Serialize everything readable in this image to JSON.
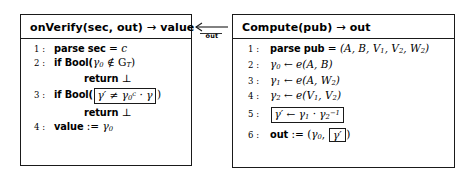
{
  "diagram": {
    "type": "algorithm-pseudocode-pair",
    "connector": {
      "label": "out",
      "direction": "right-to-left",
      "icon": "left-arrow-icon"
    }
  },
  "left_box": {
    "name": "onVerify",
    "header": {
      "fn": "onVerify",
      "args": "(sec, out)",
      "arrow": "→",
      "result": "value"
    },
    "lines": [
      {
        "no": "1 :",
        "keyword": "parse",
        "rest": " sec = c"
      },
      {
        "no": "2 :",
        "keyword": "if Bool(",
        "rest": "γ₀ ∉ G_T )"
      },
      {
        "no": "",
        "keyword": "return",
        "rest": " ⊥"
      },
      {
        "no": "3 :",
        "keyword": "if Bool(",
        "boxed": "γ′ ≠ γ₀ᶜ · γ",
        "rest": ")"
      },
      {
        "no": "",
        "keyword": "return",
        "rest": " ⊥"
      },
      {
        "no": "4 :",
        "keyword": "value",
        "rest": " := γ₀"
      }
    ]
  },
  "right_box": {
    "name": "Compute",
    "header": {
      "fn": "Compute",
      "args": "(pub)",
      "arrow": "→",
      "result": "out"
    },
    "lines": [
      {
        "no": "1 :",
        "keyword": "parse pub",
        "rest": " = (A, B, V₁, V₂, W₂)"
      },
      {
        "no": "2 :",
        "keyword": "",
        "rest": "γ₀ ← e(A, B)"
      },
      {
        "no": "3 :",
        "keyword": "",
        "rest": "γ₁ ← e(A, W₂)"
      },
      {
        "no": "4 :",
        "keyword": "",
        "rest": "γ₂ ← e(V₁, V₂)"
      },
      {
        "no": "5 :",
        "keyword": "",
        "boxed": "γ′ ← γ₁ · γ₂⁻¹"
      },
      {
        "no": "6 :",
        "keyword": "out",
        "rest": " := (γ₀, ",
        "boxed": "γ′",
        "tail": ")"
      }
    ]
  },
  "symbols": {
    "gamma": "γ",
    "notin": "∉",
    "neq": "≠",
    "bot": "⊥",
    "arrow_right": "→",
    "arrow_left_assign": "←",
    "cdot": "·",
    "assign": ":="
  }
}
